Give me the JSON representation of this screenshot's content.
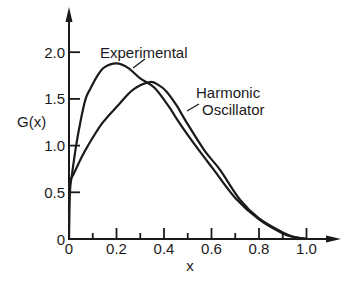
{
  "chart_data": {
    "type": "line",
    "title": "",
    "xlabel": "x",
    "ylabel": "G(x)",
    "xlim": [
      0,
      1.0
    ],
    "ylim": [
      0,
      2.3
    ],
    "grid": false,
    "legend": null,
    "x_ticks": [
      0,
      0.2,
      0.4,
      0.6,
      0.8,
      1.0
    ],
    "x_tick_labels": [
      "0",
      "0.2",
      "0.4",
      "0.6",
      "0.8",
      "1.0"
    ],
    "x_minor_ticks": [
      0.1,
      0.3,
      0.5,
      0.7,
      0.9
    ],
    "y_ticks": [
      0,
      0.5,
      1.0,
      1.5,
      2.0
    ],
    "y_tick_labels": [
      "0",
      "0.5",
      "1.0",
      "1.5",
      "2.0"
    ],
    "series": [
      {
        "name": "Experimental",
        "x": [
          0,
          0.004,
          0.012,
          0.03,
          0.05,
          0.07,
          0.09,
          0.12,
          0.15,
          0.2,
          0.25,
          0.3,
          0.36,
          0.42,
          0.45,
          0.49,
          0.55,
          0.61,
          0.7,
          0.8,
          0.9,
          0.95,
          1.0
        ],
        "y": [
          0,
          0.5,
          0.68,
          1.0,
          1.28,
          1.5,
          1.61,
          1.75,
          1.84,
          1.88,
          1.83,
          1.72,
          1.62,
          1.42,
          1.3,
          1.15,
          0.94,
          0.74,
          0.44,
          0.21,
          0.06,
          0.02,
          0
        ]
      },
      {
        "name": "Harmonic Oscillator",
        "x": [
          0,
          0.014,
          0.05,
          0.08,
          0.14,
          0.21,
          0.27,
          0.34,
          0.376,
          0.41,
          0.453,
          0.49,
          0.57,
          0.636,
          0.72,
          0.8,
          0.9,
          0.95,
          1.0
        ],
        "y": [
          0.63,
          0.67,
          0.86,
          1.0,
          1.24,
          1.44,
          1.6,
          1.68,
          1.65,
          1.58,
          1.43,
          1.27,
          0.95,
          0.74,
          0.42,
          0.22,
          0.07,
          0.02,
          0
        ]
      }
    ],
    "annotations": [
      {
        "series": "Experimental",
        "lines": [
          "Experimental"
        ]
      },
      {
        "series": "Harmonic Oscillator",
        "lines": [
          "Harmonic",
          "Oscillator"
        ]
      }
    ]
  }
}
